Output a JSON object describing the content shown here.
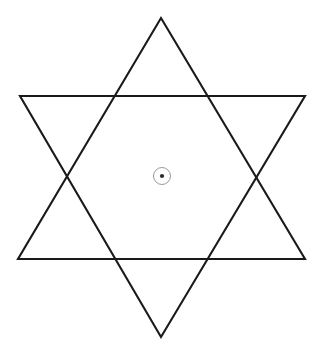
{
  "figure": {
    "canvas": {
      "width": 322,
      "height": 355,
      "background_color": "#ffffff"
    },
    "style": {
      "line_color": "#1a1a1a",
      "line_width": 2.1,
      "ring_color": "#9b9b9b",
      "ring_width": 1,
      "dot_color": "#2b2b2b"
    },
    "shapes": {
      "upward_triangle": {
        "name": "upward-triangle",
        "points": "161,18 305,259 18,259"
      },
      "downward_triangle": {
        "name": "downward-triangle",
        "points": "161,337 20,96 305,96"
      }
    },
    "center_marker": {
      "name": "center-point-marker",
      "cx": 162,
      "cy": 176,
      "ring_radius": 8.5,
      "dot_radius": 2.1
    }
  },
  "chart_data": {
    "type": "diagram",
    "subtitle": "",
    "xlabel": "",
    "ylabel": "",
    "grid": false,
    "legend": "none",
    "annotations": [],
    "elements": [
      {
        "name": "upward-triangle",
        "kind": "polygon",
        "vertices": [
          [
            161,
            18
          ],
          [
            305,
            259
          ],
          [
            18,
            259
          ]
        ],
        "stroke": "#1a1a1a",
        "fill": "none"
      },
      {
        "name": "downward-triangle",
        "kind": "polygon",
        "vertices": [
          [
            161,
            337
          ],
          [
            20,
            96
          ],
          [
            305,
            96
          ]
        ],
        "stroke": "#1a1a1a",
        "fill": "none"
      },
      {
        "name": "center-ring",
        "kind": "circle",
        "center": [
          162,
          176
        ],
        "radius": 8.5,
        "stroke": "#9b9b9b",
        "fill": "none"
      },
      {
        "name": "center-dot",
        "kind": "circle",
        "center": [
          162,
          176
        ],
        "radius": 2.1,
        "stroke": "none",
        "fill": "#2b2b2b"
      }
    ],
    "star_points": [
      [
        161,
        18
      ],
      [
        305,
        96
      ],
      [
        305,
        259
      ],
      [
        161,
        337
      ],
      [
        18,
        259
      ],
      [
        20,
        96
      ]
    ],
    "inner_hexagon_vertices": [
      [
        113,
        96
      ],
      [
        209,
        96
      ],
      [
        260,
        178
      ],
      [
        209,
        259
      ],
      [
        113,
        259
      ],
      [
        65,
        178
      ]
    ],
    "xlim": [
      0,
      322
    ],
    "ylim": [
      0,
      355
    ]
  }
}
